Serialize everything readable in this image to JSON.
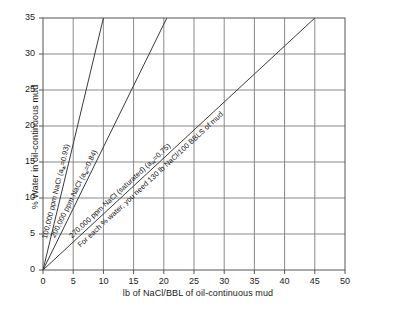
{
  "chart_data": {
    "type": "line",
    "title": "",
    "xlabel": "lb of NaCl/BBL of oil-continuous mud",
    "ylabel": "% Water in oil-continuous mud",
    "xlim": [
      0,
      50
    ],
    "ylim": [
      0,
      35
    ],
    "xticks": [
      0,
      5,
      10,
      15,
      20,
      25,
      30,
      35,
      40,
      45,
      50
    ],
    "yticks": [
      0,
      5,
      10,
      15,
      20,
      25,
      30,
      35
    ],
    "grid": true,
    "legend_position": "inline-labels",
    "series": [
      {
        "name": "100,000 ppm NaCl (aw=0.93)",
        "label": "100,000 ppm NaCl (a",
        "label_sub": "w",
        "label_tail": "=0.93)",
        "x": [
          0,
          10
        ],
        "y": [
          0,
          35
        ],
        "slope_lb_per_pct": 0.2857
      },
      {
        "name": "200,000 ppm NaCl (aw=0.84)",
        "label": "200,000 ppm NaCl (a",
        "label_sub": "w",
        "label_tail": "=0.84)",
        "x": [
          0,
          20.5
        ],
        "y": [
          0,
          35
        ],
        "slope_lb_per_pct": 0.5857
      },
      {
        "name": "270,000 ppm NaCl (saturated) (aw=0.75)",
        "label": "270,000 ppm NaCl (saturated) (a",
        "label_sub": "w",
        "label_tail": "=0.75)",
        "x": [
          0,
          45
        ],
        "y": [
          0,
          35
        ],
        "slope_lb_per_pct": 1.2857
      }
    ],
    "annotations": [
      {
        "name": "saturated-rule-of-thumb",
        "text": "For each % water, you need 130 lb NaCl/100 BBLS of mud"
      }
    ]
  },
  "ticks": {
    "x": [
      "0",
      "5",
      "10",
      "15",
      "20",
      "25",
      "30",
      "35",
      "40",
      "45",
      "50"
    ],
    "y": [
      "0",
      "5",
      "10",
      "15",
      "20",
      "25",
      "30",
      "35"
    ]
  },
  "colors": {
    "line": "#3a3a3a",
    "grid": "#7d7d7d",
    "frame": "#555555",
    "text": "#1a1a1a",
    "background": "#ffffff"
  }
}
